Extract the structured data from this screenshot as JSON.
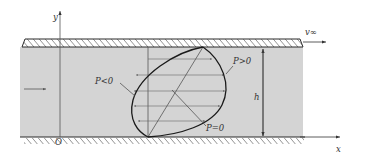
{
  "diagram": {
    "labels": {
      "y_axis": "y",
      "x_axis": "x",
      "origin": "O",
      "plate_velocity": "v∞",
      "gap_height": "h",
      "pressure_negative": "P<0",
      "pressure_positive": "P>0",
      "pressure_zero": "P=0"
    },
    "colors": {
      "fluid": "#d4d4d4",
      "lines": "#2a2a2a",
      "thin_lines": "#555555",
      "background": "#ffffff"
    },
    "elements": {
      "upper_plate": "moving plate (hatched)",
      "lower_wall": "fixed wall (hatched)",
      "profile_arrow_count": 5
    }
  }
}
